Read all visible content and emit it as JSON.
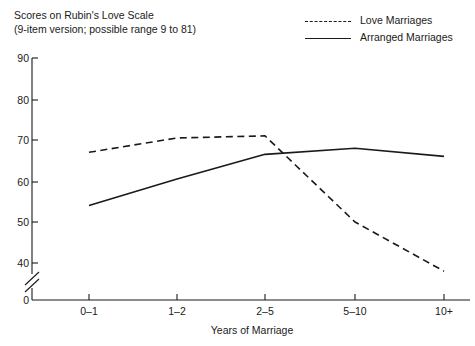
{
  "title": {
    "line1": "Scores on Rubin's Love Scale",
    "line2": "(9-item version; possible range 9 to 81)"
  },
  "legend": [
    {
      "label": "Love Marriages",
      "style": "dashed"
    },
    {
      "label": "Arranged Marriages",
      "style": "solid"
    }
  ],
  "chart_data": {
    "type": "line",
    "title": "Scores on Rubin's Love Scale (9-item version; possible range 9 to 81)",
    "xlabel": "Years of Marriage",
    "ylabel": "",
    "categories": [
      "0–1",
      "1–2",
      "2–5",
      "5–10",
      "10+"
    ],
    "series": [
      {
        "name": "Love Marriages",
        "style": "dashed",
        "values": [
          67,
          70.5,
          71,
          50,
          38
        ]
      },
      {
        "name": "Arranged Marriages",
        "style": "solid",
        "values": [
          54,
          60.5,
          66.5,
          68,
          66
        ]
      }
    ],
    "ylim": [
      0,
      90
    ],
    "yticks": [
      0,
      40,
      50,
      60,
      70,
      80,
      90
    ],
    "ytick_labels": [
      "0",
      "40",
      "50",
      "60",
      "70",
      "80",
      "90"
    ],
    "axis_break": true,
    "axis_break_between": [
      0,
      40
    ],
    "grid": false,
    "legend_position": "top-right"
  },
  "axis_labels": {
    "y": [
      "90",
      "80",
      "70",
      "60",
      "50",
      "40",
      "0"
    ],
    "x": [
      "0–1",
      "1–2",
      "2–5",
      "5–10",
      "10+"
    ],
    "x_title": "Years of Marriage"
  },
  "colors": {
    "ink": "#1a1a1a",
    "background": "#ffffff"
  }
}
